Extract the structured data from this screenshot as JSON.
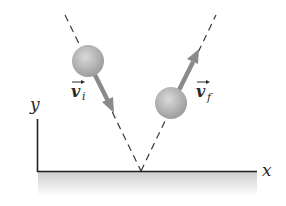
{
  "diagram": {
    "axes": {
      "x_label": "x",
      "y_label": "y"
    },
    "vectors": {
      "initial": {
        "symbol": "v",
        "subscript": "i",
        "direction": "down-right toward surface"
      },
      "final": {
        "symbol": "v",
        "subscript": "f",
        "direction": "up-right away from surface"
      }
    },
    "colors": {
      "ball": "#b5b5b5",
      "arrow": "#8a8a8a",
      "axis": "#1f1f1f",
      "dashed_path": "#3a3a3a",
      "ground_shade_top": "#cfcfcf",
      "ground_shade_bottom": "#ffffff"
    }
  }
}
